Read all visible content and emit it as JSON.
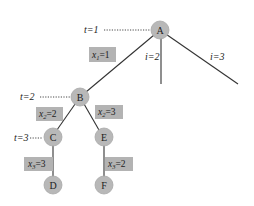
{
  "diagram": {
    "type": "search-tree",
    "nodes": {
      "A": {
        "label": "A",
        "x": 160,
        "y": 30
      },
      "B": {
        "label": "B",
        "x": 80,
        "y": 97
      },
      "C": {
        "label": "C",
        "x": 52,
        "y": 137
      },
      "E": {
        "label": "E",
        "x": 103,
        "y": 137
      },
      "D": {
        "label": "D",
        "x": 52,
        "y": 185
      },
      "F": {
        "label": "F",
        "x": 103,
        "y": 185
      }
    },
    "edges": [
      {
        "from": "A",
        "to": "B",
        "label_var": "x",
        "label_sub": "1",
        "label_val": "=1"
      },
      {
        "from": "B",
        "to": "C",
        "label_var": "x",
        "label_sub": "2",
        "label_val": "=2"
      },
      {
        "from": "B",
        "to": "E",
        "label_var": "x",
        "label_sub": "2",
        "label_val": "=3"
      },
      {
        "from": "C",
        "to": "D",
        "label_var": "x",
        "label_sub": "3",
        "label_val": "=3"
      },
      {
        "from": "E",
        "to": "F",
        "label_var": "x",
        "label_sub": "3",
        "label_val": "=2"
      }
    ],
    "open_branches": [
      {
        "from": "A",
        "label": "i=2"
      },
      {
        "from": "A",
        "label": "i=3"
      }
    ],
    "levels": [
      {
        "label": "t=1",
        "node": "A"
      },
      {
        "label": "t=2",
        "node": "B"
      },
      {
        "label": "t=3",
        "node": "C"
      }
    ],
    "text": {
      "t1": "t=1",
      "t2": "t=2",
      "t3": "t=3",
      "i2": "i=2",
      "i3": "i=3",
      "x_var": "x",
      "sub1": "1",
      "sub2": "2",
      "sub3": "3",
      "eq1": "=1",
      "eq2": "=2",
      "eq3": "=3",
      "eqB_E": "=3",
      "eqC_D": "=3",
      "eqE_F": "=2",
      "nodeA": "A",
      "nodeB": "B",
      "nodeC": "C",
      "nodeD": "D",
      "nodeE": "E",
      "nodeF": "F"
    }
  }
}
